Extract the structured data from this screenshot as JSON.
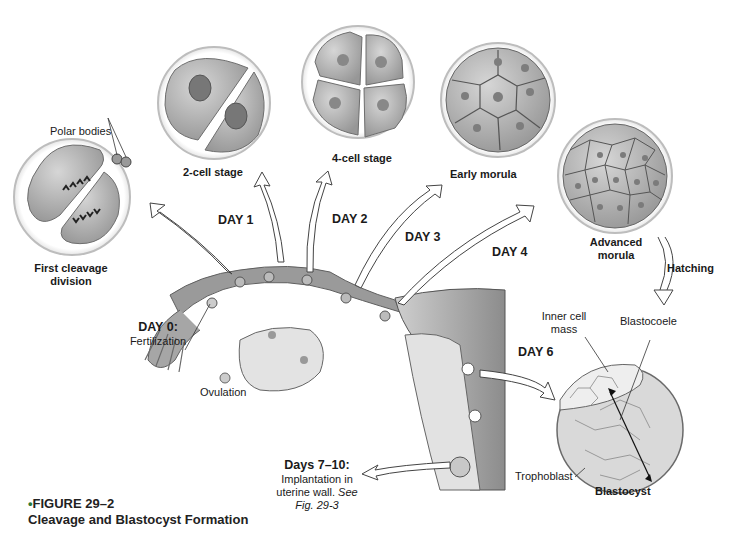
{
  "figure": {
    "number": "FIGURE 29–2",
    "title": "Cleavage and Blastocyst Formation"
  },
  "stages": {
    "first_cleavage": {
      "line1": "First cleavage",
      "line2": "division"
    },
    "polar_bodies": "Polar bodies",
    "two_cell": "2-cell stage",
    "four_cell": "4-cell stage",
    "early_morula": "Early morula",
    "advanced_morula": {
      "line1": "Advanced",
      "line2": "morula"
    },
    "hatching": "Hatching",
    "blastocyst": "Blastocyst",
    "inner_cell_mass": {
      "line1": "Inner cell",
      "line2": "mass"
    },
    "blastocoele": "Blastocoele",
    "trophoblast": "Trophoblast"
  },
  "days": {
    "day0": {
      "label": "DAY 0:",
      "desc": "Fertilization"
    },
    "day1": "DAY 1",
    "day2": "DAY 2",
    "day3": "DAY 3",
    "day4": "DAY 4",
    "day6": "DAY 6",
    "days7_10": {
      "label": "Days 7–10:",
      "line1": "Implantation in",
      "line2_plain": "uterine wall. ",
      "line2_italic": "See",
      "line3": "Fig. 29-3"
    }
  },
  "anatomy": {
    "ovulation": "Ovulation"
  },
  "colors": {
    "cell_fill": "#b8b8b8",
    "cell_dark": "#8a8a8a",
    "tube": "#9a9a9a",
    "uterus_wall": "#7d7d7d",
    "caption_bullet": "#2a7a3a"
  }
}
